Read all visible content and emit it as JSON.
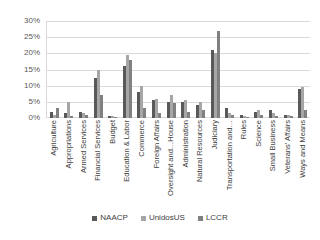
{
  "chart_data": {
    "type": "bar",
    "title": "",
    "xlabel": "",
    "ylabel": "",
    "ylim": [
      0,
      30
    ],
    "ytick_labels": [
      "0%",
      "5%",
      "10%",
      "15%",
      "20%",
      "25%",
      "30%"
    ],
    "ytick_values": [
      0,
      5,
      10,
      15,
      20,
      25,
      30
    ],
    "grid": true,
    "legend_position": "bottom-center",
    "categories": [
      "Agriculture",
      "Appropriations",
      "Armed Services",
      "Financial Services",
      "Budget",
      "Education & Labor",
      "Commerce",
      "Foreign Affairs",
      "Oversight and…House",
      "Administration",
      "Natural Resources",
      "Judiciary",
      "Transportation and…",
      "Rules",
      "Science",
      "Small Business",
      "Veterans' Affairs",
      "Ways and Means"
    ],
    "series": [
      {
        "name": "NAACP",
        "color": "#595959",
        "values": [
          2.0,
          1.5,
          2.0,
          12.5,
          0.6,
          16.0,
          8.0,
          5.5,
          5.0,
          5.0,
          4.0,
          21.0,
          3.0,
          1.0,
          2.0,
          2.5,
          1.0,
          9.0
        ]
      },
      {
        "name": "UnidosUS",
        "color": "#a6a6a6",
        "values": [
          1.0,
          5.0,
          1.5,
          15.0,
          0.6,
          19.5,
          10.0,
          6.0,
          7.0,
          5.5,
          5.0,
          20.0,
          1.5,
          0.6,
          2.5,
          1.5,
          1.0,
          9.5
        ]
      },
      {
        "name": "LCCR",
        "color": "#808080",
        "values": [
          3.0,
          0.5,
          1.0,
          7.0,
          0.2,
          18.0,
          3.0,
          1.5,
          4.5,
          2.0,
          2.5,
          27.0,
          1.0,
          0.3,
          1.0,
          0.5,
          0.5,
          2.5
        ]
      }
    ]
  },
  "legend": {
    "items": [
      {
        "label": "NAACP"
      },
      {
        "label": "UnidosUS"
      },
      {
        "label": "LCCR"
      }
    ]
  }
}
